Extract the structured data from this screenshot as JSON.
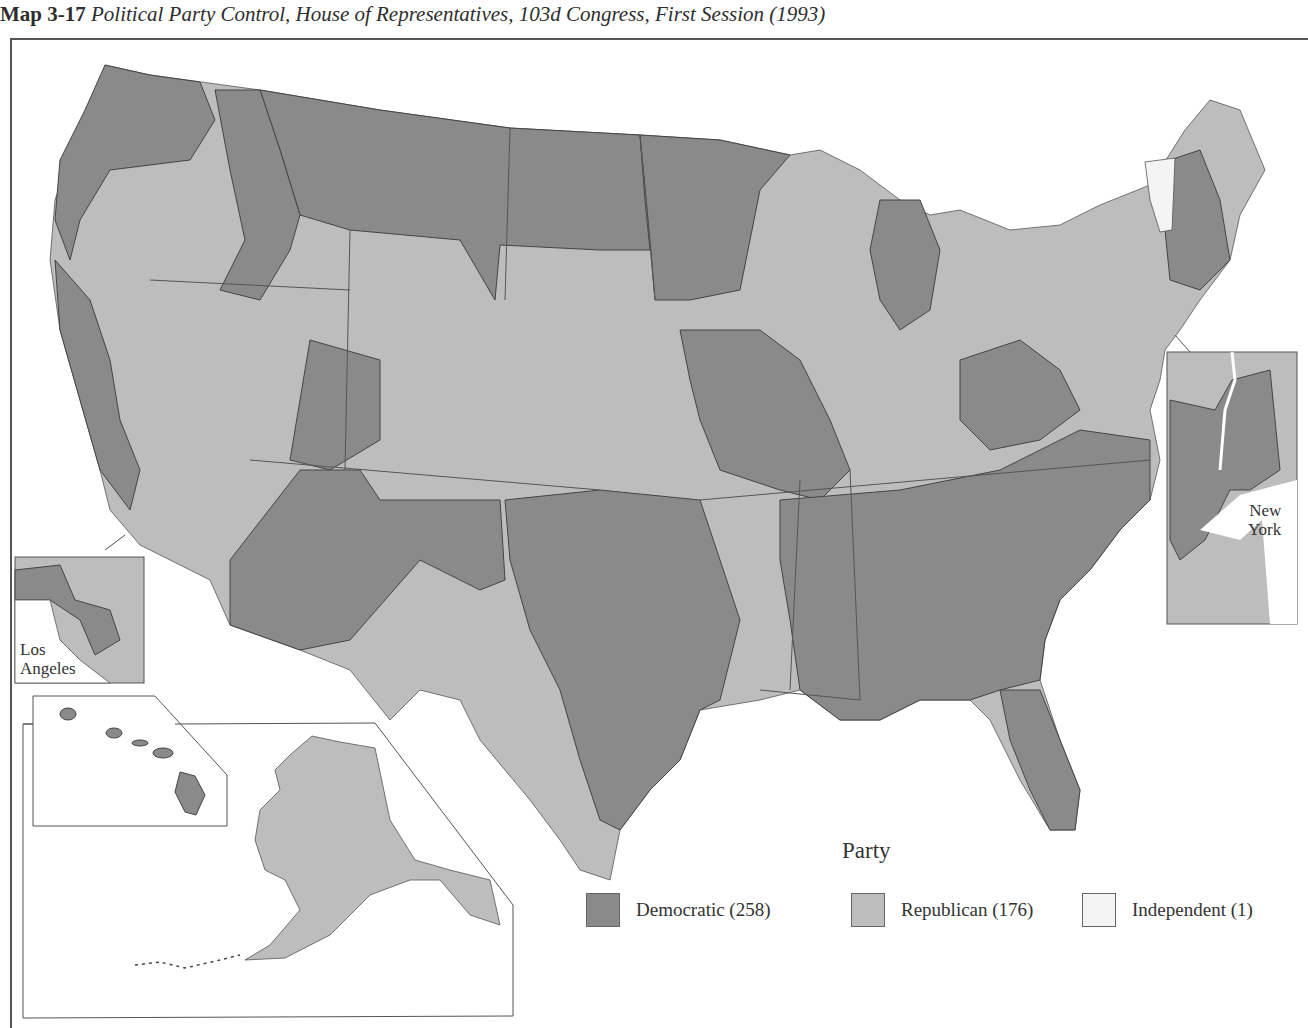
{
  "title": {
    "number": "Map 3-17",
    "text": "Political Party Control, House of Representatives, 103d Congress, First Session (1993)"
  },
  "insets": {
    "los_angeles": {
      "label_line1": "Los",
      "label_line2": "Angeles"
    },
    "new_york": {
      "label_line1": "New",
      "label_line2": "York"
    }
  },
  "legend": {
    "title": "Party",
    "items": [
      {
        "label": "Democratic (258)",
        "color": "#8a8a8a"
      },
      {
        "label": "Republican (176)",
        "color": "#bdbdbd"
      },
      {
        "label": "Independent (1)",
        "color": "#f4f4f4"
      }
    ]
  },
  "colors": {
    "democratic": "#8a8a8a",
    "republican": "#bdbdbd",
    "independent": "#f4f4f4",
    "border": "#444444"
  }
}
